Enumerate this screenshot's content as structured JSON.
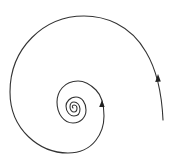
{
  "diagram": {
    "type": "spiral",
    "stroke_color": "#333333",
    "background": "#ffffff",
    "center": [
      72,
      106
    ],
    "start_point": [
      163,
      118
    ],
    "turns": 5,
    "arrows": [
      {
        "position": [
          158,
          79
        ],
        "direction": "up"
      },
      {
        "position": [
          102,
          104
        ],
        "direction": "up"
      }
    ]
  }
}
